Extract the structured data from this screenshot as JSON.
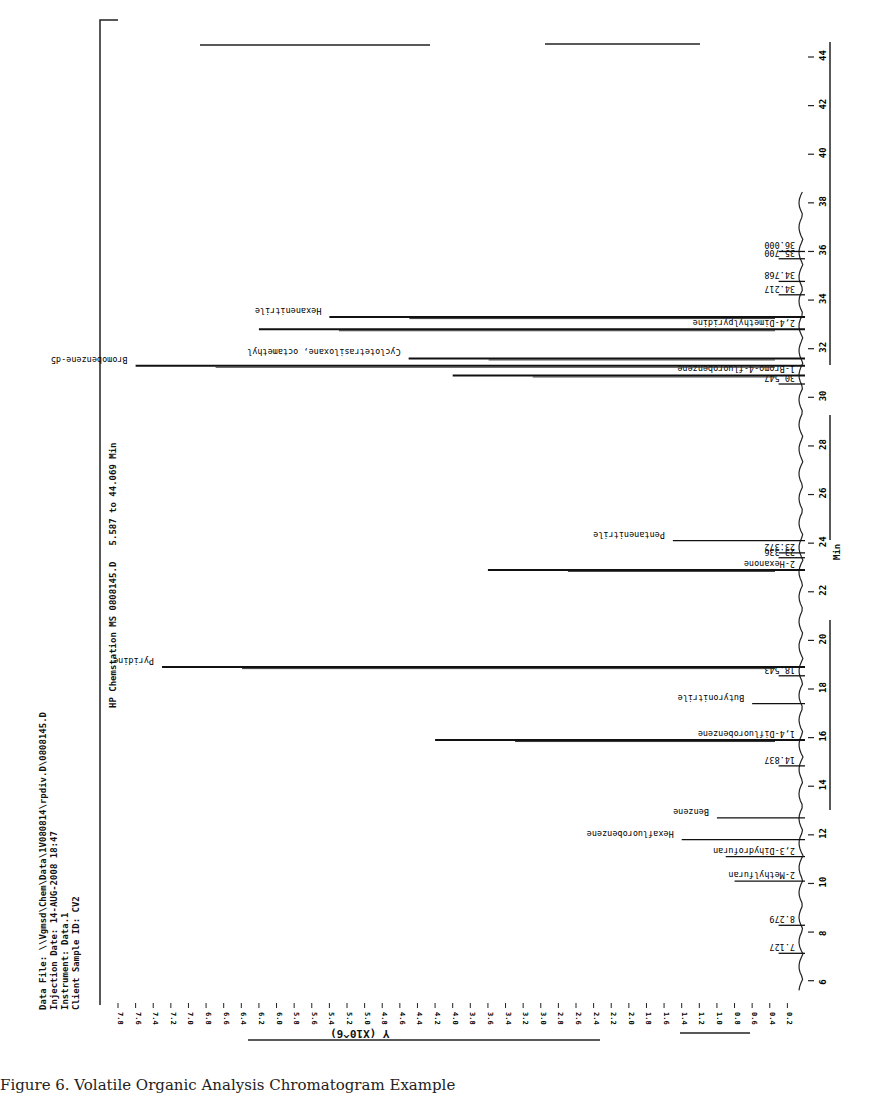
{
  "page": {
    "caption": "Figure 6. Volatile Organic Analysis Chromatogram Example",
    "header_block": {
      "data_file": "Data File: \\\\Vgmsd\\Chem\\Data\\1V080814\\rpdiv.D\\0808145.D",
      "injection_date": "Injection Date: 14-AUG-2008 18:47",
      "instrument": "Instrument: Data.1",
      "client_sample_id": "Client Sample ID: CV2"
    },
    "plot_title": "HP Chemstation MS 0808145.D",
    "range_label": "5.587 to 44.069 Min",
    "x_axis_label": "Min",
    "y_axis_label": "Y (X10^6)"
  },
  "chart_data": {
    "type": "line",
    "orientation": "rotated 90 degrees: retention time runs bottom-to-top along right edge, intensity grows leftward",
    "xlabel": "Min",
    "ylabel": "Y (X10^6)",
    "xlim": [
      5,
      44
    ],
    "ylim": [
      0.2,
      7.8
    ],
    "x_ticks": [
      6,
      8,
      10,
      12,
      14,
      16,
      18,
      20,
      22,
      24,
      26,
      28,
      30,
      32,
      34,
      36,
      38,
      40,
      42,
      44
    ],
    "y_ticks": [
      0.2,
      0.4,
      0.6,
      0.8,
      1.0,
      1.2,
      1.4,
      1.6,
      1.8,
      2.0,
      2.2,
      2.4,
      2.6,
      2.8,
      3.0,
      3.2,
      3.4,
      3.6,
      3.8,
      4.0,
      4.2,
      4.4,
      4.6,
      4.8,
      5.0,
      5.2,
      5.4,
      5.6,
      5.8,
      6.0,
      6.2,
      6.4,
      6.6,
      6.8,
      7.0,
      7.2,
      7.4,
      7.6,
      7.8
    ],
    "grid": false,
    "legend": "none",
    "peaks": [
      {
        "rt": 7.127,
        "label": "7.127",
        "intensity": 0.3
      },
      {
        "rt": 8.279,
        "label": "8.279",
        "intensity": 0.3
      },
      {
        "rt": 10.1,
        "label": "2-Methylfuran",
        "intensity": 0.8
      },
      {
        "rt": 11.1,
        "label": "2,3-Dihydrofuran",
        "intensity": 0.9
      },
      {
        "rt": 11.8,
        "label": "Hexafluorobenzene",
        "intensity": 1.4
      },
      {
        "rt": 12.7,
        "label": "Benzene",
        "intensity": 1.0
      },
      {
        "rt": 14.837,
        "label": "14.837",
        "intensity": 0.3
      },
      {
        "rt": 15.9,
        "label": "1,4-Difluorobenzene",
        "intensity": 4.2
      },
      {
        "rt": 17.4,
        "label": "Butyronitrile",
        "intensity": 0.6
      },
      {
        "rt": 18.543,
        "label": "18.543",
        "intensity": 0.3
      },
      {
        "rt": 18.9,
        "label": "Pyridine",
        "intensity": 7.3
      },
      {
        "rt": 22.9,
        "label": "2-Hexanone",
        "intensity": 3.6
      },
      {
        "rt": 23.4,
        "label": "23.336",
        "intensity": 0.3
      },
      {
        "rt": 23.6,
        "label": "23.372",
        "intensity": 0.3
      },
      {
        "rt": 24.1,
        "label": "Pentanenitrile",
        "intensity": 1.5
      },
      {
        "rt": 30.547,
        "label": "30.547",
        "intensity": 0.3
      },
      {
        "rt": 30.9,
        "label": "1-Bromo-4-fluorobenzene",
        "intensity": 4.0
      },
      {
        "rt": 31.3,
        "label": "Bromobenzene-d5",
        "intensity": 7.6
      },
      {
        "rt": 31.6,
        "label": "Cyclotetrasiloxane, octamethyl",
        "intensity": 4.5
      },
      {
        "rt": 32.8,
        "label": "2,4-Dimethylpyridine",
        "intensity": 6.2
      },
      {
        "rt": 33.3,
        "label": "Hexanenitrile",
        "intensity": 5.4
      },
      {
        "rt": 34.217,
        "label": "34.217",
        "intensity": 0.3
      },
      {
        "rt": 34.768,
        "label": "34.768",
        "intensity": 0.3
      },
      {
        "rt": 35.7,
        "label": "35.700",
        "intensity": 0.3
      },
      {
        "rt": 36.0,
        "label": "36.000",
        "intensity": 0.3
      }
    ]
  }
}
